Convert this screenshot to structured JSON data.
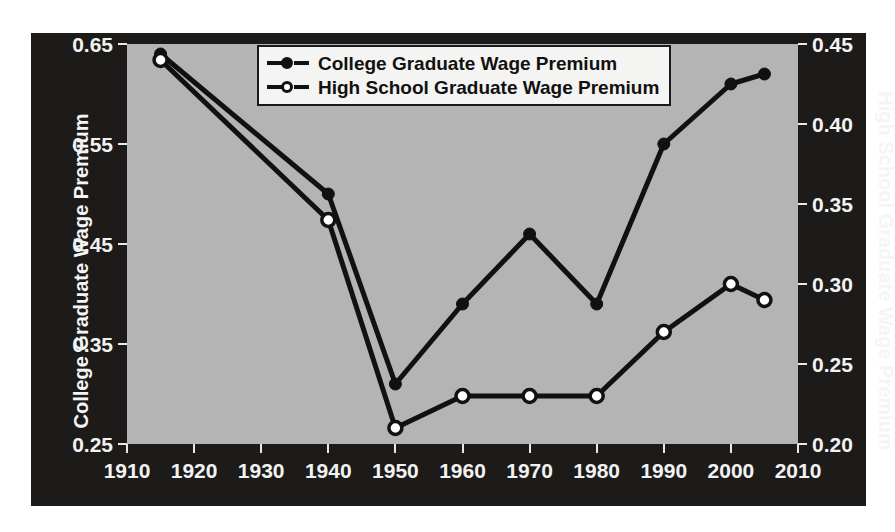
{
  "chart_data": {
    "type": "line",
    "title": "",
    "subtitle": "",
    "xlabel": "",
    "ylabel": "College Graduate Wage Premium",
    "ylabel_right": "High School Graduate Wage Premium",
    "grid": false,
    "legend_position": "top-center",
    "xlim": [
      1910,
      2010
    ],
    "xticks": [
      1910,
      1920,
      1930,
      1940,
      1950,
      1960,
      1970,
      1980,
      1990,
      2000,
      2010
    ],
    "xticklabels": [
      "1910",
      "1920",
      "1930",
      "1940",
      "1950",
      "1960",
      "1970",
      "1980",
      "1990",
      "2000",
      "2010"
    ],
    "ylim": [
      0.25,
      0.65
    ],
    "yticks": [
      0.25,
      0.35,
      0.45,
      0.55,
      0.65
    ],
    "yticklabels": [
      "0.25",
      "0.35",
      "0.45",
      "0.55",
      "0.65"
    ],
    "ylim_right": [
      0.2,
      0.45
    ],
    "yticks_right": [
      0.2,
      0.25,
      0.3,
      0.35,
      0.4,
      0.45
    ],
    "yticklabels_right": [
      "0.20",
      "0.25",
      "0.30",
      "0.35",
      "0.40",
      "0.45"
    ],
    "x": [
      1915,
      1940,
      1950,
      1960,
      1970,
      1980,
      1990,
      2000,
      2005
    ],
    "series": [
      {
        "name": "College Graduate Wage Premium",
        "axis": "left",
        "marker": "filled-circle",
        "color": "#111111",
        "values": [
          0.64,
          0.5,
          0.31,
          0.39,
          0.46,
          0.39,
          0.55,
          0.61,
          0.62
        ]
      },
      {
        "name": "High School Graduate Wage Premium",
        "axis": "right",
        "marker": "open-circle",
        "color": "#111111",
        "values": [
          0.44,
          0.34,
          0.21,
          0.23,
          0.23,
          0.23,
          0.27,
          0.3,
          0.29
        ]
      }
    ]
  },
  "legend": {
    "items": [
      {
        "label": "College Graduate Wage Premium",
        "marker": "filled-circle"
      },
      {
        "label": "High School Graduate Wage Premium",
        "marker": "open-circle"
      }
    ]
  },
  "colors": {
    "figure_background": "#1c1b1a",
    "plot_background": "#b4b4b4",
    "line": "#111111",
    "tick_text": "#f2f2f2",
    "legend_background": "#f4f4f2"
  }
}
